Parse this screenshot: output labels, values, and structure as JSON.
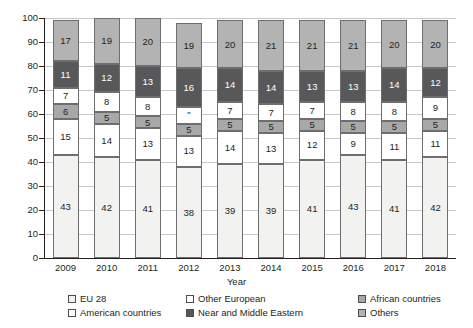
{
  "chart_data": {
    "type": "bar",
    "stacked": true,
    "title": "",
    "xlabel": "Year",
    "ylabel": "",
    "ylim": [
      0,
      100
    ],
    "yticks": [
      0,
      10,
      20,
      30,
      40,
      50,
      60,
      70,
      80,
      90,
      100
    ],
    "grid": true,
    "legend_position": "bottom",
    "categories": [
      "2009",
      "2010",
      "2011",
      "2012",
      "2013",
      "2014",
      "2015",
      "2016",
      "2017",
      "2018"
    ],
    "series": [
      {
        "name": "EU 28",
        "color": "#f2f2f0",
        "values": [
          43,
          42,
          41,
          38,
          39,
          39,
          41,
          43,
          41,
          42
        ],
        "labels": [
          "43",
          "42",
          "41",
          "38",
          "39",
          "39",
          "41",
          "43",
          "41",
          "42"
        ]
      },
      {
        "name": "American countries",
        "color": "#ffffff",
        "values": [
          15,
          14,
          13,
          13,
          14,
          13,
          12,
          9,
          11,
          11
        ],
        "labels": [
          "15",
          "14",
          "13",
          "13",
          "14",
          "13",
          "12",
          "9",
          "11",
          "11"
        ]
      },
      {
        "name": "African countries",
        "color": "#a8a8a8",
        "values": [
          6,
          5,
          5,
          5,
          5,
          5,
          5,
          5,
          5,
          5
        ],
        "labels": [
          "6",
          "5",
          "5",
          "5",
          "5",
          "5",
          "5",
          "5",
          "5",
          "5"
        ]
      },
      {
        "name": "Other European",
        "color": "#ffffff",
        "values": [
          7,
          8,
          8,
          7,
          7,
          7,
          7,
          8,
          8,
          9
        ],
        "labels": [
          "7",
          "8",
          "8",
          "\"",
          "7",
          "7",
          "7",
          "8",
          "8",
          "9"
        ]
      },
      {
        "name": "Near and Middle Eastern",
        "color": "#58585a",
        "values": [
          11,
          12,
          13,
          16,
          14,
          14,
          13,
          13,
          14,
          12
        ],
        "labels": [
          "11",
          "12",
          "13",
          "16",
          "14",
          "14",
          "13",
          "13",
          "14",
          "12"
        ]
      },
      {
        "name": "Others",
        "color": "#b3b3b3",
        "values": [
          17,
          19,
          20,
          19,
          20,
          21,
          21,
          21,
          20,
          20
        ],
        "labels": [
          "17",
          "19",
          "20",
          "19",
          "20",
          "21",
          "21",
          "21",
          "20",
          "20"
        ]
      }
    ]
  },
  "legend": {
    "items": [
      {
        "label": "EU 28",
        "color": "#f2f2f0"
      },
      {
        "label": "Other European",
        "color": "#ffffff"
      },
      {
        "label": "African countries",
        "color": "#a8a8a8"
      },
      {
        "label": "American countries",
        "color": "#ffffff"
      },
      {
        "label": "Near and Middle Eastern",
        "color": "#58585a"
      },
      {
        "label": "Others",
        "color": "#b3b3b3"
      }
    ]
  }
}
